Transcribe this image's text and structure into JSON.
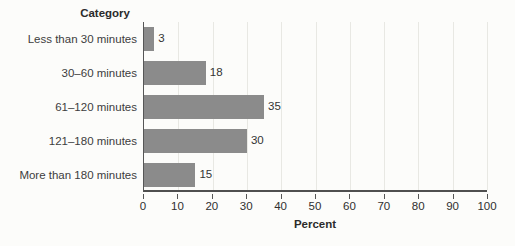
{
  "chart_data": {
    "type": "bar",
    "orientation": "horizontal",
    "title": "",
    "ylabel": "Category",
    "xlabel": "Percent",
    "categories": [
      "Less than 30 minutes",
      "30–60 minutes",
      "61–120 minutes",
      "121–180 minutes",
      "More than 180 minutes"
    ],
    "values": [
      3,
      18,
      35,
      30,
      15
    ],
    "xlim": [
      0,
      100
    ],
    "xticks": [
      0,
      10,
      20,
      30,
      40,
      50,
      60,
      70,
      80,
      90,
      100
    ],
    "grid": true,
    "legend": null,
    "bar_color": "#8b8b8b",
    "gridline_color": "#e8e8e3",
    "axis_color": "#4f4f4f",
    "background_color": "#fcfcfa"
  }
}
